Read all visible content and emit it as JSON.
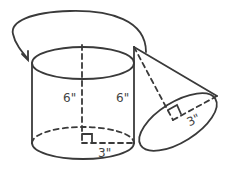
{
  "diagram": {
    "colors": {
      "stroke": "#3a3a3a",
      "label": "#444444",
      "background": "#ffffff"
    },
    "cylinder": {
      "height_label_center": "6\"",
      "height_label_side": "6\"",
      "radius_label": "3\""
    },
    "cone": {
      "radius_label": "3\""
    },
    "icons": {
      "arrow": "curved-arrow-icon",
      "right_angle_cylinder": "right-angle-marker-icon",
      "right_angle_cone": "right-angle-marker-icon"
    }
  }
}
